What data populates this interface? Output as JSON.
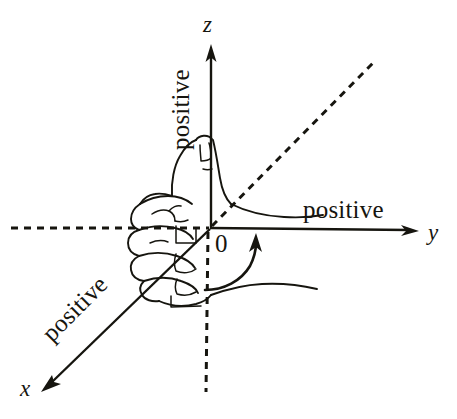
{
  "figure": {
    "background_color": "#ffffff",
    "ink_color": "#16150f"
  },
  "axes": [
    {
      "id": "z",
      "letter": "z",
      "positive_label": "positive",
      "label_rotation_deg": -90,
      "positive_direction": "up",
      "negative_style": "dashed"
    },
    {
      "id": "y",
      "letter": "y",
      "positive_label": "positive",
      "label_rotation_deg": 0,
      "positive_direction": "right",
      "negative_style": "dashed"
    },
    {
      "id": "x",
      "letter": "x",
      "positive_label": "positive",
      "label_rotation_deg": 45,
      "positive_direction": "toward-viewer-lower-left",
      "negative_style": "dashed"
    }
  ],
  "origin": {
    "label": "0",
    "x": 210,
    "y": 228
  },
  "annotations": {
    "rotation_arrow": "curved-arrow-counterclockwise",
    "hand": "right-hand-fist-thumb-up"
  }
}
